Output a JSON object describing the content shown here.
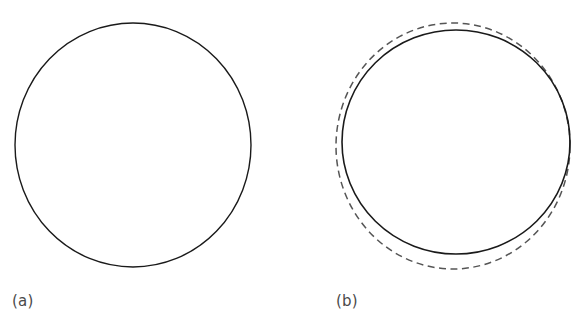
{
  "figure": {
    "background_color": "#ffffff",
    "width": 588,
    "height": 324,
    "panels": [
      {
        "id": "a",
        "label": "(a)",
        "label_color": "#4a4a4a",
        "curves": [
          {
            "name": "reference-circle",
            "style": "solid",
            "color": "#1a1a1a",
            "stroke_width": 1.4,
            "center_x": 133,
            "center_y": 145,
            "radius_x": 118,
            "radius_y": 122
          }
        ]
      },
      {
        "id": "b",
        "label": "(b)",
        "label_color": "#4a4a4a",
        "curves": [
          {
            "name": "reference-circle",
            "style": "solid",
            "color": "#1a1a1a",
            "stroke_width": 1.6,
            "center_x": 162,
            "center_y": 142,
            "radius_x": 114,
            "radius_y": 112
          },
          {
            "name": "comparison-circle",
            "style": "dashed",
            "color": "#555555",
            "stroke_width": 1.5,
            "dash_length": 7,
            "gap_length": 4.5,
            "center_x": 159,
            "center_y": 146,
            "radius_x": 117,
            "radius_y": 123
          }
        ]
      }
    ]
  },
  "chart_data": {
    "type": "line",
    "title": "",
    "subtitle": "",
    "xlabel": "",
    "ylabel": "",
    "grid": false,
    "legend_position": "none",
    "annotations": [
      "(a)",
      "(b)"
    ],
    "series": [
      {
        "name": "panel-a-solid-circle",
        "panel": "a",
        "linestyle": "solid",
        "color": "#1a1a1a",
        "shape": "circle",
        "center": [
          133,
          145
        ],
        "radii": [
          118,
          122
        ]
      },
      {
        "name": "panel-b-solid-circle",
        "panel": "b",
        "linestyle": "solid",
        "color": "#1a1a1a",
        "shape": "circle",
        "center": [
          456,
          142
        ],
        "radii": [
          114,
          112
        ]
      },
      {
        "name": "panel-b-dashed-circle",
        "panel": "b",
        "linestyle": "dashed",
        "color": "#555555",
        "shape": "circle",
        "center": [
          453,
          146
        ],
        "radii": [
          117,
          123
        ]
      }
    ]
  }
}
